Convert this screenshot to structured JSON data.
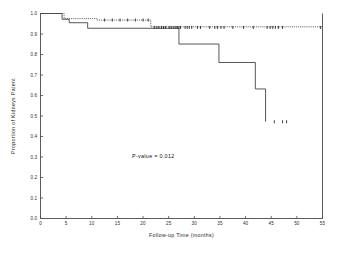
{
  "chart_data": {
    "type": "line",
    "subtype": "kaplan-meier-step",
    "title": "",
    "xlabel": "Follow-up Time (months)",
    "ylabel": "Proportion of Kidneys Patent",
    "xlim": [
      0,
      55
    ],
    "ylim": [
      0.0,
      1.0
    ],
    "grid": false,
    "legend_position": "none",
    "xticks": [
      0,
      5,
      10,
      15,
      20,
      25,
      30,
      35,
      40,
      45,
      50,
      55
    ],
    "xticklabels": [
      "0",
      "5",
      "10",
      "15",
      "20",
      "25",
      "30",
      "35",
      "40",
      "45",
      "50",
      "55"
    ],
    "yticks": [
      0.0,
      0.1,
      0.2,
      0.3,
      0.4,
      0.5,
      0.6,
      0.7,
      0.8,
      0.9,
      1.0
    ],
    "yticklabels": [
      "0.0",
      "0.1",
      "0.2",
      "0.3",
      "0.4",
      "0.5",
      "0.6",
      "0.7",
      "0.8",
      "0.9",
      "1.0"
    ],
    "annotations": [
      {
        "text": "P-value = 0.012",
        "x": 22.0,
        "y": 0.295
      }
    ],
    "series": [
      {
        "name": "group-upper",
        "style": "dotted",
        "steps_x": [
          0,
          4.6,
          4.6,
          11.0,
          11.0,
          21.5,
          21.5,
          55.0
        ],
        "steps_y": [
          1.0,
          1.0,
          0.975,
          0.975,
          0.968,
          0.968,
          0.935,
          0.935
        ],
        "censor_x": [
          12.5,
          14.0,
          15.5,
          17.0,
          18.5,
          20.0,
          21.0
        ],
        "censor_y": 0.968
      },
      {
        "name": "group-lower",
        "style": "solid",
        "steps_x": [
          0,
          4.2,
          4.2,
          5.6,
          5.6,
          9.2,
          9.2,
          27.0,
          27.0,
          34.8,
          34.8,
          41.9,
          41.9,
          43.9,
          43.9
        ],
        "steps_y": [
          1.0,
          1.0,
          0.972,
          0.972,
          0.955,
          0.955,
          0.928,
          0.928,
          0.851,
          0.851,
          0.761,
          0.761,
          0.632,
          0.632,
          0.472
        ],
        "censor_x": [
          45.6,
          47.2,
          48.0
        ],
        "censor_y": 0.472
      }
    ],
    "censor_marks_upper_band": {
      "y": 0.932,
      "x": [
        22.2,
        22.7,
        23.1,
        23.6,
        24.0,
        24.4,
        25.1,
        25.5,
        26.0,
        26.4,
        26.7,
        27.0,
        27.3,
        28.2,
        28.6,
        29.0,
        29.5,
        30.6,
        31.2,
        33.0,
        34.0,
        34.5,
        35.2,
        35.8,
        37.5,
        39.6,
        41.5,
        44.2,
        44.8,
        45.3,
        45.8,
        46.4,
        47.2,
        54.6
      ]
    }
  },
  "axis": {
    "x_title": "Follow-up Time (months)",
    "y_title": "Proportion of Kidneys Patent"
  },
  "annotation": {
    "pvalue_text": "P-value = 0.012"
  },
  "colors": {
    "line": "#3a3a3a",
    "axis": "#4a4a4a",
    "text": "#111111",
    "background": "#ffffff"
  }
}
